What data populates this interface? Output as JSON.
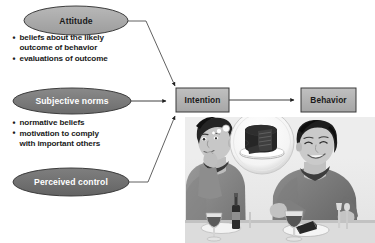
{
  "diagram": {
    "nodes": {
      "attitude": {
        "label": "Attitude",
        "shape": "ellipse",
        "fill": "#a8a8a8",
        "text_color": "#1a1a1a"
      },
      "subjective_norms": {
        "label": "Subjective norms",
        "shape": "ellipse",
        "fill": "#7a7a7a",
        "text_color": "#ffffff"
      },
      "perceived_control": {
        "label": "Perceived control",
        "shape": "ellipse",
        "fill": "#6f6f6f",
        "text_color": "#ffffff"
      },
      "intention": {
        "label": "Intention",
        "shape": "rectangle",
        "fill": "#b4b4b4",
        "text_color": "#1a1a1a"
      },
      "behavior": {
        "label": "Behavior",
        "shape": "rectangle",
        "fill": "#b4b4b4",
        "text_color": "#1a1a1a"
      }
    },
    "bullet_groups": [
      {
        "id": "attitude-bullets",
        "belongs_to": "attitude",
        "items": [
          "beliefs about the likely\noutcome of behavior",
          "evaluations of outcome"
        ]
      },
      {
        "id": "subjective-norms-bullets",
        "belongs_to": "subjective_norms",
        "items": [
          "normative beliefs",
          "motivation to comply\nwith important others"
        ]
      }
    ],
    "connectors": [
      {
        "from": "attitude",
        "to": "intention",
        "style": "elbow-down"
      },
      {
        "from": "subjective_norms",
        "to": "intention",
        "style": "straight"
      },
      {
        "from": "perceived_control",
        "to": "intention",
        "style": "elbow-up"
      },
      {
        "from": "intention",
        "to": "behavior",
        "style": "straight"
      }
    ],
    "photo": {
      "description": "Two young people seated at a dinner table",
      "thought_bubble": {
        "content": "chocolate cake on a plate"
      },
      "table_items": [
        "wine glass",
        "wine glass",
        "plate",
        "cake slice",
        "bottle",
        "cutlery"
      ]
    }
  }
}
